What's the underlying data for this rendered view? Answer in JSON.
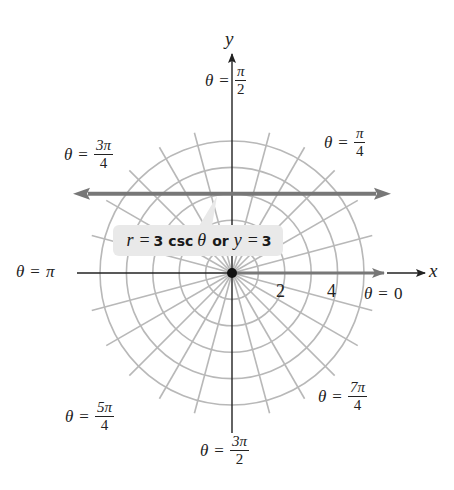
{
  "figure": {
    "center": {
      "x": 232,
      "y": 273
    },
    "unit_px": 26.4,
    "grid": {
      "circle_radii": [
        1,
        2,
        3,
        4,
        5
      ],
      "radial_line_step_deg": 15,
      "radial_line_extent": 5.5,
      "color": "#b8b8b8"
    },
    "axes": {
      "x_label": "x",
      "y_label": "y",
      "tick_labels": [
        {
          "value": 2,
          "text": "2"
        },
        {
          "value": 4,
          "text": "4"
        }
      ],
      "axis_color": "#222222",
      "polar_axis_color": "#777777"
    },
    "curve": {
      "polar_equation": "r = 3 csc θ",
      "cartesian_equation": "y = 3",
      "y_value": 3,
      "color": "#777777"
    },
    "callout": {
      "r": "r",
      "eq1": "=",
      "three1": "3",
      "csc": "csc",
      "theta": "θ",
      "or": "or",
      "y": "y",
      "eq2": "=",
      "three2": "3"
    },
    "angle_labels": {
      "theta_symbol": "θ",
      "equals": "=",
      "pi_over_2": {
        "num": "π",
        "den": "2"
      },
      "three_pi_over_4": {
        "num": "3π",
        "den": "4"
      },
      "pi_over_4": {
        "num": "π",
        "den": "4"
      },
      "pi": "π",
      "zero": "0",
      "five_pi_over_4": {
        "num": "5π",
        "den": "4"
      },
      "seven_pi_over_4": {
        "num": "7π",
        "den": "4"
      },
      "three_pi_over_2": {
        "num": "3π",
        "den": "2"
      }
    }
  }
}
